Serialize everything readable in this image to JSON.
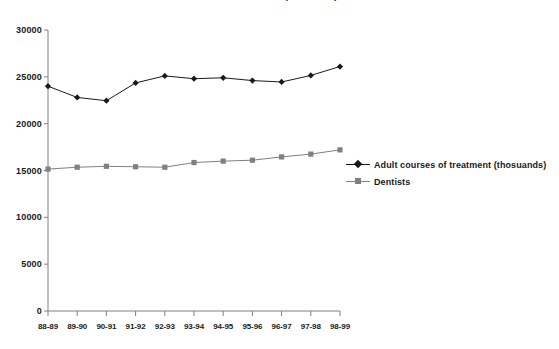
{
  "chart_data": {
    "type": "line",
    "title": "Adult courses of treatment (thousands) and dentists",
    "xlabel": "",
    "ylabel": "",
    "categories": [
      "88-89",
      "89-90",
      "90-91",
      "91-92",
      "92-93",
      "93-94",
      "94-95",
      "95-96",
      "96-97",
      "97-98",
      "98-99"
    ],
    "ylim": [
      0,
      30000
    ],
    "yticks": [
      0,
      5000,
      10000,
      15000,
      20000,
      25000,
      30000
    ],
    "ytick_labels": [
      "0",
      "5000",
      "10000",
      "15000",
      "20000",
      "25000",
      "30000"
    ],
    "grid": false,
    "legend_position": "right",
    "series": [
      {
        "name": "Adult courses of treatment (thosuands)",
        "color": "#1a1a1a",
        "marker": "diamond",
        "values": [
          24000,
          22800,
          22450,
          24350,
          25100,
          24800,
          24900,
          24600,
          24450,
          25150,
          26100
        ]
      },
      {
        "name": "Dentists",
        "color": "#808080",
        "marker": "square",
        "values": [
          15150,
          15350,
          15450,
          15400,
          15350,
          15850,
          16000,
          16100,
          16450,
          16750,
          17200
        ]
      }
    ]
  },
  "colors": {
    "axis": "#808080",
    "series1": "#1a1a1a",
    "series2": "#808080",
    "background": "#ffffff",
    "text": "#1a1a1a"
  }
}
